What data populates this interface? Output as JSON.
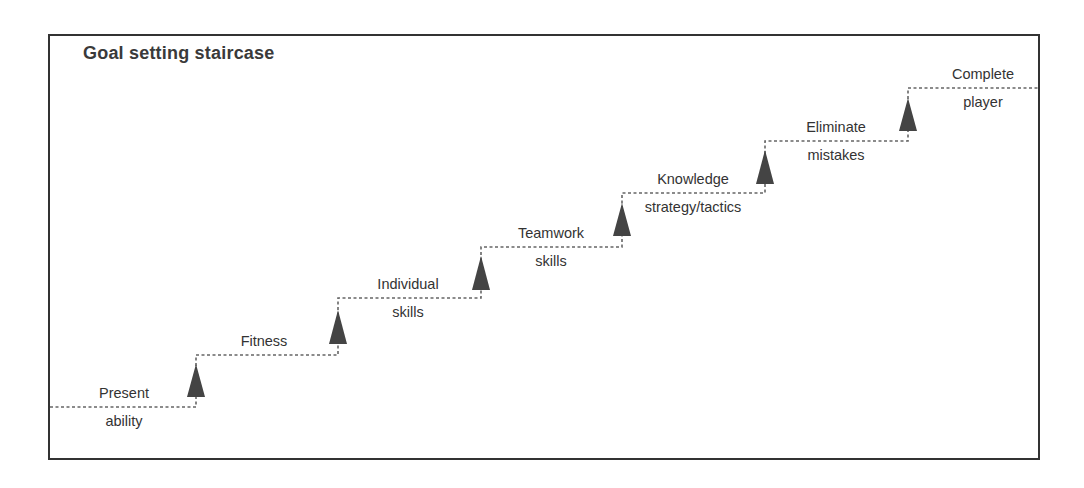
{
  "title": "Goal setting staircase",
  "colors": {
    "border": "#333333",
    "line": "#666666",
    "arrow": "#444444",
    "text": "#333333"
  },
  "steps": [
    {
      "top": "Present",
      "bottom": "ability"
    },
    {
      "top": "Fitness",
      "bottom": ""
    },
    {
      "top": "Individual",
      "bottom": "skills"
    },
    {
      "top": "Teamwork",
      "bottom": "skills"
    },
    {
      "top": "Knowledge",
      "bottom": "strategy/tactics"
    },
    {
      "top": "Eliminate",
      "bottom": "mistakes"
    },
    {
      "top": "Complete",
      "bottom": "player"
    }
  ],
  "arrow_icon": "up-triangle-icon"
}
